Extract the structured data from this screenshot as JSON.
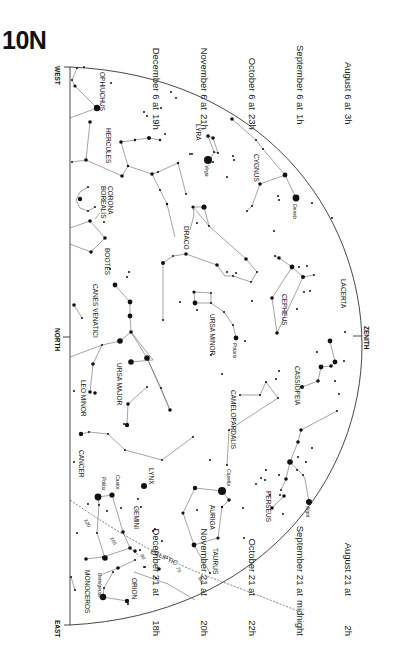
{
  "title": "10N",
  "times_top": [
    {
      "date": "August 6 at",
      "hour": "3h"
    },
    {
      "date": "September 6 at",
      "hour": "1h"
    },
    {
      "date": "October 6 at",
      "hour": "23h"
    },
    {
      "date": "November 6 at",
      "hour": "21h"
    },
    {
      "date": "December 6 at",
      "hour": "19h"
    }
  ],
  "times_bottom": [
    {
      "date": "August 21 at",
      "hour": "2h"
    },
    {
      "date": "September 21 at",
      "hour": "midnight"
    },
    {
      "date": "October 21 at",
      "hour": "22h"
    },
    {
      "date": "November 21 at",
      "hour": "20h"
    },
    {
      "date": "December 21 at",
      "hour": "18h"
    }
  ],
  "directions": {
    "west": "WEST",
    "north": "NORTH",
    "east": "EAST",
    "zenith": "ZENITH"
  },
  "constellations": {
    "ophiuchus": "OPHIUCHUS",
    "hercules": "HERCULES",
    "corona_borealis_1": "CORONA",
    "corona_borealis_2": "BOREALIS",
    "bootes": "BOOTES",
    "canes_venatici": "CANES VENATICI",
    "lyra": "LYRA",
    "cygnus": "CYGNUS",
    "draco": "DRACO",
    "ursa_minor": "URSA MINOR",
    "cepheus": "CEPHEUS",
    "lacerta": "LACERTA",
    "cassiopeia": "CASSIOPEIA",
    "camelopardalis": "CAMELOPARDALIS",
    "ursa_major": "URSA MAJOR",
    "leo_minor": "LEO MINOR",
    "lynx": "LYNX",
    "cancer": "CANCER",
    "gemini": "GEMINI",
    "auriga": "AURIGA",
    "perseus": "PERSEUS",
    "taurus": "TAURUS",
    "orion": "ORION",
    "monoceros": "MONOCEROS"
  },
  "stars": {
    "vega": "Vega",
    "deneb": "Deneb",
    "polaris": "Polaris",
    "capella": "Capella",
    "algol": "Algol",
    "castor": "Castor",
    "pollux": "Pollux",
    "betelgeuse": "Betelgeuse"
  },
  "ecliptic": {
    "label": "ECLIPTIC",
    "degrees": [
      "120",
      "105",
      "90",
      "75",
      "60"
    ]
  },
  "colors": {
    "line": "#555555",
    "star": "#111111",
    "background": "#ffffff"
  }
}
